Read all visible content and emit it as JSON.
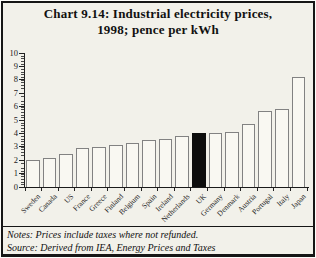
{
  "title": {
    "line1": "Chart 9.14: Industrial electricity prices,",
    "line2": "1998; pence per kWh"
  },
  "notes": {
    "line1": "Notes: Prices include taxes where not refunded.",
    "line2": "Source: Derived from  IEA, Energy Prices and Taxes"
  },
  "colors": {
    "background": "#f2f1ea",
    "bar_fill": "#f9f8f2",
    "bar_outline": "#828282",
    "highlight_bar": "#0d0d0d",
    "axis": "#1b1b1b",
    "text": "#111111"
  },
  "chart_data": {
    "type": "bar",
    "title": "Chart 9.14: Industrial electricity prices, 1998; pence per kWh",
    "categories": [
      "Sweden",
      "Canada",
      "US",
      "France",
      "Greece",
      "Finland",
      "Belgium",
      "Spain",
      "Ireland",
      "Netherlands",
      "UK",
      "Germany",
      "Denmark",
      "Austria",
      "Portugal",
      "Italy",
      "Japan"
    ],
    "values": [
      2.0,
      2.2,
      2.5,
      2.9,
      3.0,
      3.1,
      3.3,
      3.5,
      3.6,
      3.8,
      4.0,
      4.0,
      4.1,
      4.7,
      5.7,
      5.8,
      8.2
    ],
    "highlighted_category": "UK",
    "xlabel": "",
    "ylabel": "pence per kWh",
    "ylim": [
      0,
      10
    ],
    "y_ticks": [
      0,
      1,
      2,
      3,
      4,
      5,
      6,
      7,
      8,
      9,
      10
    ],
    "grid": false,
    "legend": false,
    "bar_style": "white outline bars, highlighted category solid black"
  }
}
